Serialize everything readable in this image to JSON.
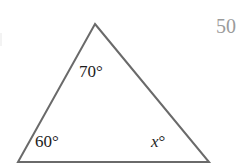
{
  "figure": {
    "background_color": "#ffffff",
    "stroke_color": "#6a6a6a",
    "stroke_width": 2,
    "text_color": "#1d1d1d",
    "muted_text_color": "#9b9b9b",
    "vertices": {
      "apex": {
        "x": 95,
        "y": 24
      },
      "bottom_left": {
        "x": 18,
        "y": 162
      },
      "bottom_right": {
        "x": 209,
        "y": 162
      }
    },
    "labels": {
      "apex_angle": "70°",
      "bottom_left_angle": "60°",
      "bottom_right_angle_variable": "x",
      "bottom_right_angle_degree": "°"
    },
    "corner_number": "50"
  },
  "chart_data": {
    "type": "diagram",
    "shape": "triangle",
    "annotations": [
      {
        "vertex": "apex",
        "label": "70°",
        "value": 70,
        "x": 95,
        "y": 24
      },
      {
        "vertex": "bottom-left",
        "label": "60°",
        "value": 60,
        "x": 18,
        "y": 162
      },
      {
        "vertex": "bottom-right",
        "label": "x°",
        "value": null,
        "x": 209,
        "y": 162
      }
    ],
    "loose_text": [
      {
        "text": "50",
        "x": 216,
        "y": 16
      }
    ]
  }
}
